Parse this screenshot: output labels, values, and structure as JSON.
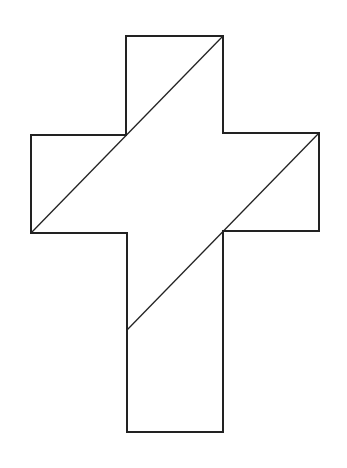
{
  "figure": {
    "stroke_color": "#222222",
    "fill_color": "#ffffff",
    "stroke_width": 2,
    "diagonal_stroke_width": 1.3,
    "outline_points": [
      [
        126,
        36
      ],
      [
        223,
        36
      ],
      [
        223,
        133
      ],
      [
        319,
        133
      ],
      [
        319,
        231
      ],
      [
        223,
        231
      ],
      [
        223,
        432
      ],
      [
        127,
        432
      ],
      [
        127,
        233
      ],
      [
        31,
        233
      ],
      [
        31,
        135
      ],
      [
        126,
        135
      ]
    ],
    "diagonals": [
      {
        "from": [
          223,
          36
        ],
        "to": [
          31,
          233
        ]
      },
      {
        "from": [
          319,
          133
        ],
        "to": [
          127,
          330
        ]
      }
    ]
  }
}
